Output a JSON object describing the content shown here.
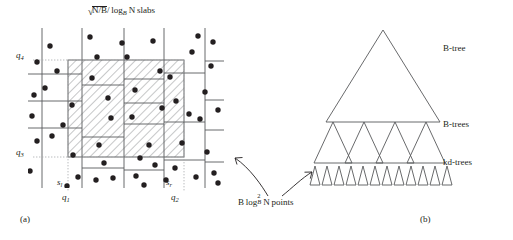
{
  "figure": {
    "panel_a": {
      "caption": "(a)",
      "title_parts": {
        "sqrt_num": "N/B",
        "slash": "/",
        "log_base": "B",
        "log_arg": "N",
        "word": "slabs",
        "full": "√N/B/ log_B N slabs"
      },
      "axis_labels": {
        "q4": "q",
        "q4_sub": "4",
        "q3": "q",
        "q3_sub": "3",
        "q1": "q",
        "q1_sub": "1",
        "q2": "q",
        "q2_sub": "2",
        "sl": "s",
        "sl_sub": "l",
        "sr": "s",
        "sr_sub": "r"
      },
      "slab_boundaries_x": [
        42,
        82,
        124,
        164,
        205
      ],
      "query_rect": {
        "x": 68,
        "y": 60,
        "width": 116,
        "height": 97
      },
      "plot_area": {
        "x": 28,
        "y": 28,
        "width": 196,
        "height": 160
      },
      "points_count": 52,
      "points": [
        [
          37,
          62
        ],
        [
          34,
          95
        ],
        [
          32,
          116
        ],
        [
          37,
          141
        ],
        [
          30,
          171
        ],
        [
          52,
          136
        ],
        [
          45,
          88
        ],
        [
          50,
          46
        ],
        [
          57,
          71
        ],
        [
          63,
          125
        ],
        [
          72,
          105
        ],
        [
          73,
          155
        ],
        [
          67,
          186
        ],
        [
          78,
          177
        ],
        [
          90,
          37
        ],
        [
          97,
          57
        ],
        [
          92,
          78
        ],
        [
          99,
          145
        ],
        [
          108,
          98
        ],
        [
          111,
          118
        ],
        [
          104,
          163
        ],
        [
          96,
          204
        ],
        [
          113,
          192
        ],
        [
          127,
          57
        ],
        [
          132,
          117
        ],
        [
          135,
          90
        ],
        [
          122,
          31
        ],
        [
          140,
          158
        ],
        [
          136,
          176
        ],
        [
          144,
          204
        ],
        [
          130,
          213
        ],
        [
          153,
          41
        ],
        [
          160,
          71
        ],
        [
          162,
          108
        ],
        [
          149,
          145
        ],
        [
          155,
          190
        ],
        [
          170,
          77
        ],
        [
          176,
          101
        ],
        [
          182,
          143
        ],
        [
          175,
          168
        ],
        [
          166,
          208
        ],
        [
          192,
          52
        ],
        [
          198,
          36
        ],
        [
          205,
          92
        ],
        [
          200,
          119
        ],
        [
          211,
          66
        ],
        [
          207,
          152
        ],
        [
          214,
          186
        ],
        [
          196,
          177
        ],
        [
          218,
          210
        ],
        [
          189,
          114
        ],
        [
          193,
          209
        ]
      ]
    },
    "panel_b": {
      "caption": "(b)",
      "labels": {
        "root": "B-tree",
        "middle": "B-trees",
        "leaf": "kd-trees"
      },
      "annotation": {
        "prefix": "B",
        "log": "log",
        "exp": "2",
        "base": "B",
        "arg": "N",
        "suffix": "points",
        "full": "B log²_B N points"
      },
      "tree_counts": {
        "root": 1,
        "middle": 4,
        "leaf": 12
      }
    },
    "colors": {
      "ink": "#231f20",
      "line": "#58595b",
      "hatch": "#808285",
      "dotted": "#a7a9ac"
    }
  }
}
